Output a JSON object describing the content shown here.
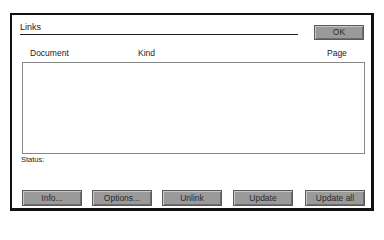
{
  "dialog": {
    "title": "Links",
    "ok_label": "OK"
  },
  "list": {
    "columns": [
      {
        "label": "Document"
      },
      {
        "label": "Kind"
      },
      {
        "label": "Page"
      }
    ],
    "rows": []
  },
  "status": {
    "label": "Status:",
    "value": ""
  },
  "buttons": [
    {
      "label": "Info...",
      "mnemonic": "I"
    },
    {
      "label": "Options...",
      "mnemonic": "O"
    },
    {
      "label": "Unlink",
      "mnemonic": "n"
    },
    {
      "label": "Update",
      "mnemonic": "U"
    },
    {
      "label": "Update all",
      "mnemonic": "a"
    }
  ],
  "colors": {
    "button_face": "#9a9a9a",
    "border": "#111111",
    "background": "#ffffff"
  }
}
